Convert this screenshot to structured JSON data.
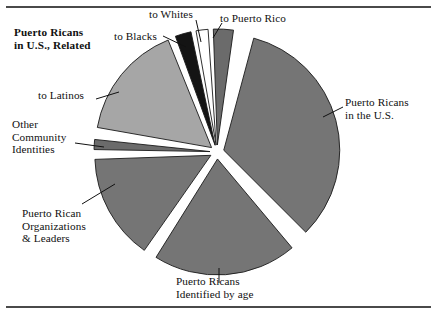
{
  "figure": {
    "title_line1": "Puerto Ricans",
    "title_line2": "in U.S., Related"
  },
  "labels": {
    "to_blacks": "to Blacks",
    "to_whites": "to Whites",
    "to_puerto_rico": "to Puerto Rico",
    "pr_in_us": "Puerto Ricans\nin the U.S.",
    "to_latinos": "to Latinos",
    "other_community": "Other\nCommunity\nIdentities",
    "pr_orgs": "Puerto Rican\nOrganizations\n& Leaders",
    "pr_by_age": "Puerto Ricans\nIdentified by age"
  },
  "colors": {
    "slice_medium_gray": "#757575",
    "slice_light_gray": "#a6a6a6",
    "slice_dark_gray": "#6b6b6b",
    "slice_black": "#141414",
    "slice_white": "#ffffff",
    "outline": "#1a1a1a",
    "rule": "#4a4a4a",
    "background": "#ffffff",
    "text": "#101010"
  },
  "chart_data": {
    "type": "pie",
    "exploded": true,
    "start_angle_deg": -2,
    "direction": "clockwise",
    "center": [
      217,
      152
    ],
    "radius": 116,
    "legend": "none (direct labels with leader lines)",
    "labels": [
      "to Puerto Rico",
      "Puerto Ricans in the U.S.",
      "Puerto Ricans Identified by age",
      "Puerto Rican Organizations & Leaders",
      "Other Community Identities",
      "to Latinos",
      "to Blacks",
      "to Whites"
    ],
    "values": [
      2.8,
      33.3,
      20.0,
      14.7,
      1.4,
      16.1,
      2.2,
      1.7
    ],
    "units": "percent",
    "slices": [
      {
        "label": "to Puerto Rico",
        "start_deg": -2,
        "end_deg": 8,
        "sweep_deg": 10,
        "value": 2.8,
        "color": "#6b6b6b",
        "explode": true
      },
      {
        "label": "Puerto Ricans in the U.S.",
        "start_deg": 15,
        "end_deg": 135,
        "sweep_deg": 120,
        "value": 33.3,
        "color": "#757575",
        "explode": true
      },
      {
        "label": "Puerto Ricans Identified by age",
        "start_deg": 140,
        "end_deg": 212,
        "sweep_deg": 72,
        "value": 20.0,
        "color": "#757575",
        "explode": true
      },
      {
        "label": "Puerto Rican Organizations & Leaders",
        "start_deg": 215,
        "end_deg": 268,
        "sweep_deg": 53,
        "value": 14.7,
        "color": "#757575",
        "explode": true
      },
      {
        "label": "Other Community Identities",
        "start_deg": 271,
        "end_deg": 276,
        "sweep_deg": 5,
        "value": 1.4,
        "color": "#6b6b6b",
        "explode": true
      },
      {
        "label": "to Latinos",
        "start_deg": 280,
        "end_deg": 338,
        "sweep_deg": 58,
        "value": 16.1,
        "color": "#a6a6a6",
        "explode": true
      },
      {
        "label": "to Blacks",
        "start_deg": 340,
        "end_deg": 348,
        "sweep_deg": 8,
        "value": 2.2,
        "color": "#141414",
        "explode": true
      },
      {
        "label": "to Whites",
        "start_deg": 350,
        "end_deg": 356,
        "sweep_deg": 6,
        "value": 1.7,
        "color": "#ffffff",
        "explode": true
      }
    ]
  }
}
